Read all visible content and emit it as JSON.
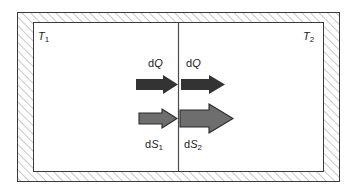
{
  "figure": {
    "type": "thermodynamics-schematic",
    "colors": {
      "hatch_line": "#8c8c8c",
      "hatch_background": "#ffffff",
      "frame_stroke": "#3a3a3a",
      "inner_fill": "#ffffff",
      "divider": "#4a4a4a",
      "heat_arrow_fill": "#333333",
      "entropy_arrow_fill": "#6e6e6e",
      "entropy_arrow_stroke": "#2b2b2b",
      "label_text": "#1a1a1a"
    },
    "outer_frame": {
      "x": 17,
      "y": 12,
      "width": 323,
      "height": 170,
      "hatched": true
    },
    "inner_box": {
      "x": 33,
      "y": 22,
      "width": 291,
      "height": 150
    },
    "divider": {
      "x": 178,
      "y_top": 22,
      "y_bottom": 172
    }
  },
  "labels": {
    "left_reservoir": {
      "symbol": "T",
      "subscript": "1",
      "text": "T1"
    },
    "right_reservoir": {
      "symbol": "T",
      "subscript": "2",
      "text": "T2"
    },
    "heat_in": {
      "prefix": "d",
      "symbol": "Q",
      "subscript": "",
      "text": "dQ"
    },
    "heat_out": {
      "prefix": "d",
      "symbol": "Q",
      "subscript": "",
      "text": "dQ"
    },
    "entropy_in": {
      "prefix": "d",
      "symbol": "S",
      "subscript": "1",
      "text": "dS1"
    },
    "entropy_out": {
      "prefix": "d",
      "symbol": "S",
      "subscript": "2",
      "text": "dS2"
    }
  },
  "arrows": [
    {
      "name": "heat-arrow-left",
      "quantity": "dQ",
      "side": "left",
      "style": "solid-dark",
      "x": 136,
      "y": 75,
      "length": 42,
      "shaft_height": 11,
      "head_height": 19
    },
    {
      "name": "heat-arrow-right",
      "quantity": "dQ",
      "side": "right",
      "style": "solid-dark",
      "x": 180,
      "y": 75,
      "length": 45,
      "shaft_height": 11,
      "head_height": 19
    },
    {
      "name": "entropy-arrow-left",
      "quantity": "dS1",
      "side": "left",
      "style": "gray-outlined",
      "x": 139,
      "y": 109,
      "length": 39,
      "shaft_height": 11,
      "head_height": 19
    },
    {
      "name": "entropy-arrow-right",
      "quantity": "dS2",
      "side": "right",
      "style": "gray-outlined",
      "x": 180,
      "y": 104,
      "length": 52,
      "shaft_height": 17,
      "head_height": 28
    }
  ]
}
